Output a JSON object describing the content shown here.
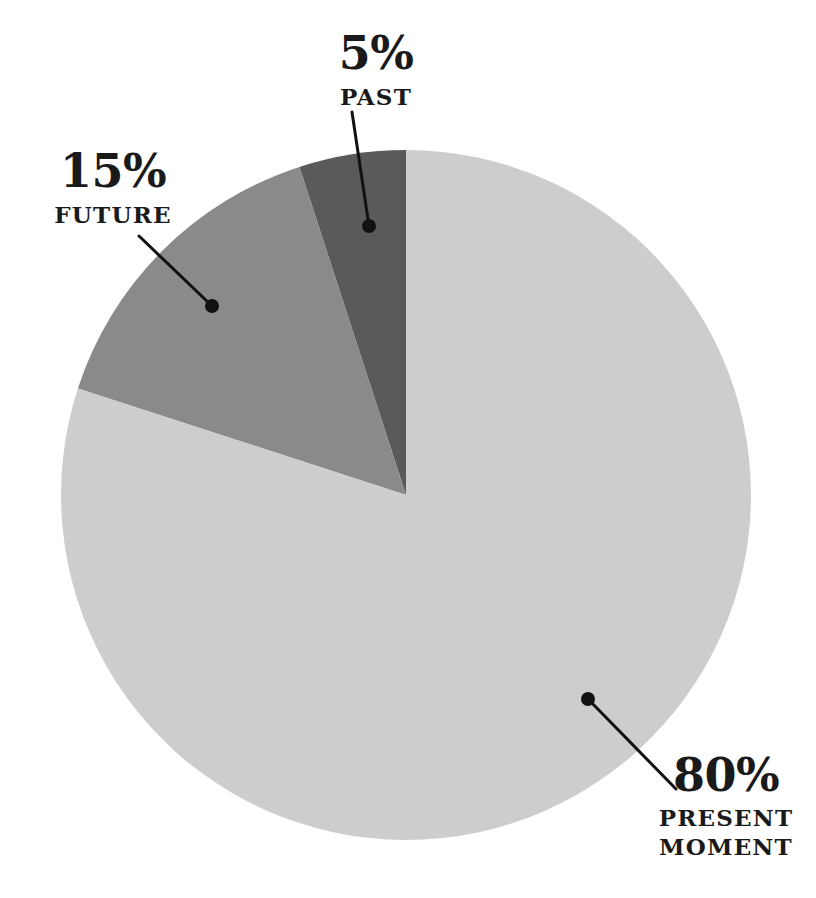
{
  "chart_data": {
    "type": "pie",
    "title": "",
    "subtitle": "",
    "xlabel": "",
    "ylabel": "",
    "legend_position": "inline-callout-labels",
    "grid": false,
    "background_color": "#ffffff",
    "total": 100,
    "units": "percent",
    "start_angle_deg": 0,
    "direction": "counterclockwise",
    "categories": [
      "PAST",
      "FUTURE",
      "PRESENT MOMENT"
    ],
    "values": [
      5,
      15,
      80
    ],
    "colors": [
      "#5a5a5a",
      "#8a8a8a",
      "#cdcdcd"
    ],
    "slices": [
      {
        "name": "PAST",
        "value": 5,
        "percent_label": "5%",
        "name_label": "PAST",
        "name_label_line2": "",
        "color": "#5a5a5a",
        "start_angle_deg": 0,
        "end_angle_deg": 18
      },
      {
        "name": "FUTURE",
        "value": 15,
        "percent_label": "15%",
        "name_label": "FUTURE",
        "name_label_line2": "",
        "color": "#8a8a8a",
        "start_angle_deg": 18,
        "end_angle_deg": 72
      },
      {
        "name": "PRESENT MOMENT",
        "value": 80,
        "percent_label": "80%",
        "name_label": "PRESENT",
        "name_label_line2": "MOMENT",
        "color": "#cdcdcd",
        "start_angle_deg": 72,
        "end_angle_deg": 360
      }
    ],
    "geometry": {
      "center_x": 406,
      "center_y": 495,
      "radius": 345
    },
    "leader_lines": [
      {
        "name": "past",
        "x1": 352,
        "y1": 112,
        "x2": 369,
        "y2": 226,
        "dot_x": 369,
        "dot_y": 226,
        "dot_r": 7,
        "color": "#111111",
        "width": 3
      },
      {
        "name": "future",
        "x1": 139,
        "y1": 236,
        "x2": 212,
        "y2": 306,
        "dot_x": 212,
        "dot_y": 306,
        "dot_r": 7,
        "color": "#111111",
        "width": 3
      },
      {
        "name": "present",
        "x1": 676,
        "y1": 789,
        "x2": 588,
        "y2": 699,
        "dot_x": 588,
        "dot_y": 699,
        "dot_r": 7,
        "color": "#111111",
        "width": 3
      }
    ]
  },
  "labels": {
    "past": {
      "percent": "5%",
      "name": "PAST",
      "name2": ""
    },
    "future": {
      "percent": "15%",
      "name": "FUTURE",
      "name2": ""
    },
    "present": {
      "percent": "80%",
      "name": "PRESENT",
      "name2": "MOMENT"
    }
  }
}
